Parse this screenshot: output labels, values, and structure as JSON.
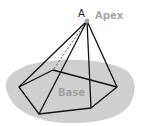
{
  "diagram": {
    "labels": {
      "apex_letter": "A",
      "apex": "Apex",
      "base": "Base"
    },
    "colors": {
      "edge": "#111111",
      "shadow": "#cfcfcf",
      "apex_dot": "#a8a8a8",
      "label_gray": "#a8a8a8"
    },
    "apex": {
      "x": 87,
      "y": 21
    },
    "base_vertices": [
      {
        "name": "left",
        "x": 19,
        "y": 87
      },
      {
        "name": "bottom-left",
        "x": 39,
        "y": 114
      },
      {
        "name": "bottom-right",
        "x": 91,
        "y": 108
      },
      {
        "name": "right",
        "x": 117,
        "y": 87
      },
      {
        "name": "back",
        "x": 53,
        "y": 70
      }
    ],
    "hidden_edge": "apex-to-back (dashed)"
  }
}
